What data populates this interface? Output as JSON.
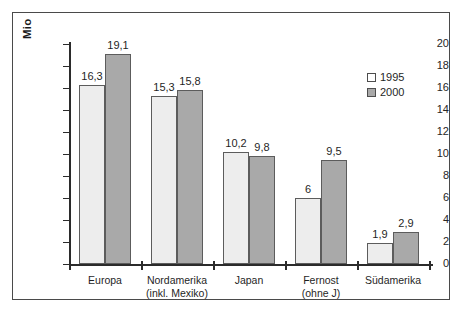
{
  "chart_data": {
    "type": "bar",
    "title": "",
    "xlabel": "",
    "ylabel": "Mio",
    "ylim": [
      0,
      20
    ],
    "yticks": [
      "0",
      "2",
      "4",
      "6",
      "8",
      "10",
      "12",
      "14",
      "16",
      "18",
      "20"
    ],
    "grid": false,
    "legend_position": "top-right",
    "categories": [
      "Europa",
      "Nordamerika\n(inkl. Mexiko)",
      "Japan",
      "Fernost\n(ohne J)",
      "Südamerika"
    ],
    "series": [
      {
        "name": "1995",
        "color": "#ededed",
        "values": [
          16.3,
          15.3,
          10.2,
          6.0,
          1.9
        ],
        "labels": [
          "16,3",
          "15,3",
          "10,2",
          "6",
          "1,9"
        ]
      },
      {
        "name": "2000",
        "color": "#a9a9a9",
        "values": [
          19.1,
          15.8,
          9.8,
          9.5,
          2.9
        ],
        "labels": [
          "19,1",
          "15,8",
          "9,8",
          "9,5",
          "2,9"
        ]
      }
    ]
  },
  "legend": {
    "items": [
      {
        "label": "1995"
      },
      {
        "label": "2000"
      }
    ]
  },
  "colors": {
    "series_1995": "#ededed",
    "series_2000": "#a9a9a9",
    "axis": "#2b2b2b",
    "frame": "#4a4a4a"
  }
}
